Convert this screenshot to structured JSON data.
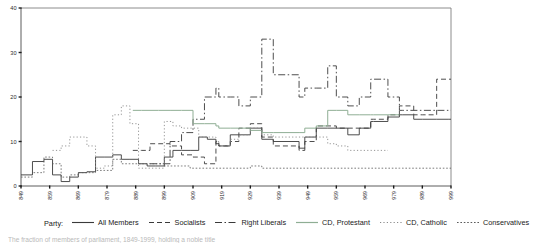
{
  "figure": {
    "caption": "The fraction of members of parliament, 1849-1999, holding a noble title"
  },
  "legend": {
    "title": "Party:",
    "entries": [
      {
        "label": "All Members",
        "dash": "none",
        "color": "#3a3a3a",
        "width": 0.9
      },
      {
        "label": "Socialists",
        "dash": "5,3",
        "color": "#3a3a3a",
        "width": 0.9
      },
      {
        "label": "Right Liberals",
        "dash": "7,2.5,1.5,2.5",
        "color": "#3a3a3a",
        "width": 0.9
      },
      {
        "label": "CD, Protestant",
        "dash": "none",
        "color": "#8fae94",
        "width": 1.0
      },
      {
        "label": "CD, Catholic",
        "dash": "1.2,2.2",
        "color": "#8a8a8a",
        "width": 0.9
      },
      {
        "label": "Conservatives",
        "dash": "1.6,1.8",
        "color": "#5a5a5a",
        "width": 0.8
      }
    ]
  },
  "chart_data": {
    "type": "line",
    "title": "",
    "xlabel": "",
    "ylabel": "",
    "xlim": [
      1849,
      1999
    ],
    "ylim": [
      0,
      40
    ],
    "yticks": [
      0,
      10,
      20,
      30,
      40
    ],
    "xticks": [
      1849,
      1859,
      1869,
      1879,
      1889,
      1899,
      1909,
      1919,
      1929,
      1939,
      1949,
      1959,
      1969,
      1979,
      1989,
      1999
    ],
    "grid": false,
    "legend_position": "below",
    "series": [
      {
        "name": "All Members",
        "dash": "none",
        "color": "#3a3a3a",
        "width": 0.9,
        "x": [
          1849,
          1853,
          1857,
          1860,
          1863,
          1866,
          1869,
          1872,
          1875,
          1878,
          1881,
          1884,
          1887,
          1890,
          1893,
          1896,
          1899,
          1902,
          1905,
          1908,
          1911,
          1914,
          1917,
          1918,
          1922,
          1925,
          1929,
          1933,
          1937,
          1946,
          1948,
          1952,
          1956,
          1959,
          1963,
          1967,
          1971,
          1972,
          1977,
          1981,
          1982,
          1986,
          1989,
          1994,
          1998,
          1999
        ],
        "y": [
          2.5,
          5.5,
          6.0,
          2.5,
          1.0,
          2.0,
          3.0,
          3.2,
          6.5,
          6.5,
          7.0,
          6.0,
          6.0,
          5.0,
          4.5,
          4.5,
          6.5,
          8.0,
          8.0,
          8.0,
          11.0,
          10.5,
          9.5,
          9.0,
          11.5,
          11.5,
          13.0,
          10.5,
          10.0,
          8.5,
          11.0,
          13.0,
          13.0,
          13.0,
          11.5,
          13.0,
          14.5,
          14.5,
          15.5,
          16.0,
          16.0,
          15.0,
          15.0,
          15.0,
          15.0,
          15.0
        ]
      },
      {
        "name": "Socialists",
        "dash": "5,3",
        "color": "#3a3a3a",
        "width": 0.9,
        "x": [
          1888,
          1891,
          1894,
          1897,
          1901,
          1905,
          1909,
          1913,
          1917,
          1918,
          1922,
          1925,
          1929,
          1933,
          1937,
          1946,
          1948,
          1952,
          1956,
          1959,
          1963,
          1967,
          1971,
          1972,
          1977,
          1981,
          1982,
          1986,
          1989,
          1994,
          1998,
          1999
        ],
        "y": [
          8.0,
          8.0,
          9.5,
          9.5,
          9.0,
          7.0,
          6.5,
          5.0,
          10.0,
          9.0,
          10.0,
          13.0,
          14.0,
          11.0,
          9.0,
          8.0,
          10.0,
          13.5,
          13.5,
          13.0,
          13.0,
          13.0,
          15.0,
          15.0,
          16.0,
          18.0,
          18.0,
          16.0,
          16.0,
          24.0,
          24.0,
          24.0
        ]
      },
      {
        "name": "Right Liberals",
        "dash": "7,2.5,1.5,2.5",
        "color": "#3a3a3a",
        "width": 0.9,
        "x": [
          1894,
          1897,
          1901,
          1905,
          1909,
          1913,
          1917,
          1918,
          1922,
          1925,
          1929,
          1933,
          1937,
          1946,
          1948,
          1952,
          1956,
          1959,
          1963,
          1967,
          1971,
          1972,
          1977,
          1981,
          1982,
          1986,
          1989,
          1994,
          1998,
          1999
        ],
        "y": [
          5.0,
          5.0,
          10.0,
          12.0,
          15.0,
          20.0,
          22.0,
          20.0,
          20.0,
          18.0,
          20.0,
          33.0,
          25.0,
          20.0,
          22.0,
          22.0,
          27.0,
          20.0,
          18.0,
          20.0,
          24.0,
          24.0,
          20.0,
          17.0,
          17.0,
          17.0,
          17.0,
          17.0,
          17.0,
          17.0
        ]
      },
      {
        "name": "CD, Protestant",
        "dash": "none",
        "color": "#8fae94",
        "width": 1.0,
        "x": [
          1888,
          1891,
          1894,
          1897,
          1901,
          1905,
          1909,
          1913,
          1917,
          1918,
          1922,
          1925,
          1929,
          1933,
          1937,
          1946,
          1948,
          1952,
          1956,
          1959,
          1963,
          1967,
          1971,
          1972,
          1977,
          1981
        ],
        "y": [
          17.0,
          17.0,
          17.0,
          17.0,
          17.0,
          17.0,
          14.0,
          14.0,
          13.5,
          13.0,
          13.0,
          13.0,
          12.5,
          12.0,
          12.0,
          12.0,
          13.0,
          13.5,
          17.0,
          17.0,
          16.0,
          16.0,
          16.0,
          16.0,
          16.0,
          16.0
        ]
      },
      {
        "name": "CD, Catholic",
        "dash": "1.2,2.2",
        "color": "#8a8a8a",
        "width": 0.9,
        "x": [
          1860,
          1863,
          1866,
          1869,
          1872,
          1875,
          1878,
          1881,
          1884,
          1887,
          1890,
          1893,
          1896,
          1899,
          1902,
          1905,
          1908,
          1911,
          1914,
          1917,
          1918,
          1922,
          1925,
          1929,
          1933,
          1937,
          1946,
          1948,
          1952,
          1956,
          1959,
          1963,
          1967,
          1971,
          1972,
          1977
        ],
        "y": [
          8.0,
          9.0,
          11.0,
          11.0,
          9.0,
          4.0,
          4.5,
          16.0,
          18.0,
          14.0,
          4.0,
          4.0,
          4.0,
          14.5,
          13.5,
          13.0,
          13.0,
          11.0,
          11.0,
          10.0,
          9.0,
          10.5,
          11.5,
          13.0,
          11.5,
          11.0,
          11.0,
          11.0,
          11.0,
          9.5,
          9.0,
          8.0,
          8.0,
          8.0,
          8.0,
          8.0
        ]
      },
      {
        "name": "Conservatives",
        "dash": "1.6,1.8",
        "color": "#5a5a5a",
        "width": 0.8,
        "x": [
          1849,
          1853,
          1857,
          1860,
          1863,
          1866,
          1869,
          1872,
          1875,
          1878,
          1881,
          1884,
          1887,
          1890,
          1893,
          1896,
          1899,
          1902,
          1905,
          1908,
          1911,
          1914,
          1917,
          1918,
          1922,
          1925,
          1929,
          1933,
          1937,
          1946,
          1948,
          1952,
          1956,
          1959,
          1963,
          1967,
          1971,
          1972,
          1977,
          1981,
          1982,
          1986,
          1989,
          1994,
          1998,
          1999
        ],
        "y": [
          2.0,
          3.0,
          6.5,
          5.0,
          2.0,
          2.5,
          3.0,
          3.0,
          3.5,
          3.5,
          6.0,
          5.0,
          5.0,
          5.0,
          5.0,
          5.0,
          4.5,
          4.5,
          4.5,
          4.0,
          4.0,
          4.0,
          4.0,
          4.0,
          4.0,
          4.0,
          4.5,
          4.0,
          4.0,
          4.0,
          4.0,
          4.0,
          4.0,
          4.0,
          4.0,
          4.0,
          4.0,
          4.0,
          4.0,
          4.0,
          4.0,
          4.0,
          4.0,
          4.0,
          4.0,
          4.0
        ]
      }
    ]
  }
}
